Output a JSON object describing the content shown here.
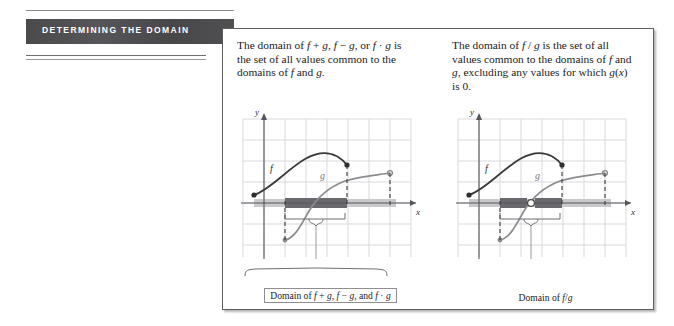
{
  "margin": {
    "header_label": "DETERMINING THE DOMAIN",
    "band_color": "#4b4b4d",
    "rule_color": "#8d8d8d"
  },
  "panels": [
    {
      "id": "sum-difference-product",
      "blurb_html": "The domain of <i>f</i> + <i>g</i>, <i>f</i> &minus; <i>g</i>, or <i>f</i> &middot; <i>g</i> is the set of all values common to the domains of <i>f</i> and <i>g</i>.",
      "blurb_text": "The domain of f + g, f − g, or f · g is the set of all values common to the domains of f and g.",
      "figure": {
        "y_axis_label": "y",
        "x_axis_label": "x",
        "curve_labels": {
          "f": "f",
          "g": "g"
        },
        "f_color": "#3a3a3d",
        "g_color": "#8b8b8f",
        "domain_bar_light_color": "#c9c9cc",
        "domain_bar_dark_color": "#6a6a6e",
        "grid_color": "#d8d8dc",
        "axis_color": "#55555a",
        "has_hole": false,
        "brace": true
      },
      "caption": "Domain of f + g, f − g, and f · g",
      "caption_html": "Domain of <i>f</i> + <i>g</i>, <i>f</i> &minus; <i>g</i>, and <i>f</i> &middot; <i>g</i>",
      "caption_boxed": true
    },
    {
      "id": "quotient",
      "blurb_html": "The domain of <i>f</i> / <i>g</i> is the set of all values common to the domains of <i>f</i> and <i>g</i>, excluding any values for which <i>g</i>(<i>x</i>) is 0.",
      "blurb_text": "The domain of f / g is the set of all values common to the domains of f and g, excluding any values for which g(x) is 0.",
      "figure": {
        "y_axis_label": "y",
        "x_axis_label": "x",
        "curve_labels": {
          "f": "f",
          "g": "g"
        },
        "f_color": "#3a3a3d",
        "g_color": "#8b8b8f",
        "domain_bar_light_color": "#c9c9cc",
        "domain_bar_dark_color": "#6a6a6e",
        "grid_color": "#d8d8dc",
        "axis_color": "#55555a",
        "has_hole": true,
        "brace": true
      },
      "caption": "Domain of f/g",
      "caption_html": "Domain of <i>f</i>/<i>g</i>",
      "caption_boxed": false
    }
  ]
}
